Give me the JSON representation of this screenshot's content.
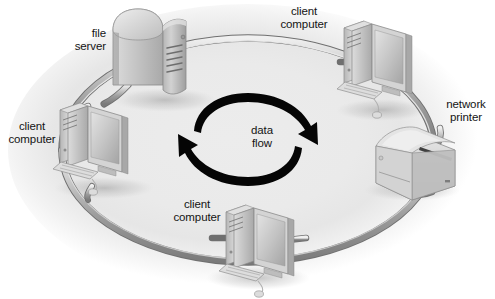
{
  "diagram": {
    "type": "ring-network-topology",
    "background_color": "#eaeaea",
    "page_background": "#ffffff",
    "cable_color": "#9a9a9a",
    "arrow_color": "#000000",
    "device_color": "#c8c8c8"
  },
  "labels": {
    "file_server": "file\nserver",
    "file_server_line1": "file",
    "file_server_line2": "server",
    "client_top_line1": "client",
    "client_top_line2": "computer",
    "network_printer_line1": "network",
    "network_printer_line2": "printer",
    "client_left_line1": "client",
    "client_left_line2": "computer",
    "client_bottom_line1": "client",
    "client_bottom_line2": "computer",
    "data_flow_line1": "data",
    "data_flow_line2": "flow"
  },
  "nodes": [
    {
      "id": "file-server",
      "name": "file server",
      "kind": "server",
      "position": "top-left"
    },
    {
      "id": "client-top",
      "name": "client computer",
      "kind": "computer",
      "position": "top-right"
    },
    {
      "id": "network-printer",
      "name": "network printer",
      "kind": "printer",
      "position": "right"
    },
    {
      "id": "client-bottom",
      "name": "client computer",
      "kind": "computer",
      "position": "bottom"
    },
    {
      "id": "client-left",
      "name": "client computer",
      "kind": "computer",
      "position": "left"
    }
  ],
  "data_flow": {
    "direction": "clockwise",
    "arrow_count": 2,
    "caption_line1": "data",
    "caption_line2": "flow"
  }
}
